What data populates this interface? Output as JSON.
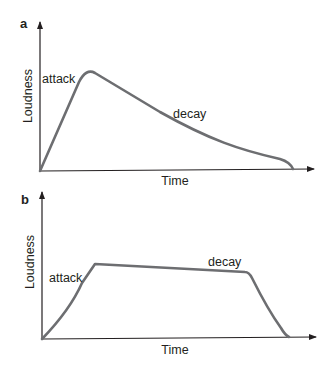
{
  "panels": [
    {
      "label": "a",
      "xlabel": "Time",
      "ylabel": "Loudness",
      "annotations": {
        "attack": "attack",
        "decay": "decay"
      }
    },
    {
      "label": "b",
      "xlabel": "Time",
      "ylabel": "Loudness",
      "annotations": {
        "attack": "attack",
        "decay": "decay"
      }
    }
  ],
  "colors": {
    "curve": "#6d6e71",
    "axis": "#231f20",
    "text": "#231f20"
  }
}
